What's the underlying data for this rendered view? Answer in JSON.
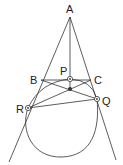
{
  "diagram": {
    "type": "geometry",
    "points": {
      "A": {
        "label": "A",
        "x": 70,
        "y": 17
      },
      "B": {
        "label": "B",
        "x": 41,
        "y": 80
      },
      "C": {
        "label": "C",
        "x": 91,
        "y": 80
      },
      "P": {
        "label": "P",
        "x": 70,
        "y": 79
      },
      "Q": {
        "label": "Q",
        "x": 97,
        "y": 99
      },
      "R": {
        "label": "R",
        "x": 28,
        "y": 108
      }
    },
    "labels": {
      "A": "A",
      "B": "B",
      "C": "C",
      "P": "P",
      "Q": "Q",
      "R": "R"
    }
  }
}
